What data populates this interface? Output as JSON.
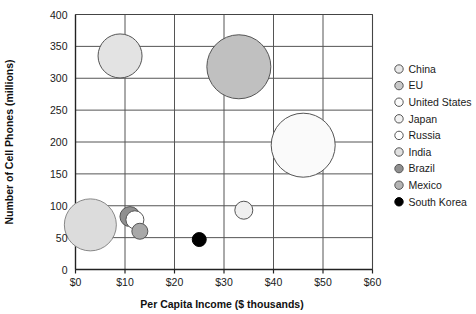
{
  "chart_data": {
    "type": "scatter",
    "variant": "bubble",
    "title": "",
    "xlabel": "Per Capita Income ($ thousands)",
    "ylabel": "Number of Cell Phones (millions)",
    "xlim": [
      0,
      60
    ],
    "ylim": [
      0,
      400
    ],
    "xticks": [
      0,
      10,
      20,
      30,
      40,
      50,
      60
    ],
    "xtick_labels": [
      "$0",
      "$10",
      "$20",
      "$30",
      "$40",
      "$50",
      "$60"
    ],
    "yticks": [
      0,
      50,
      100,
      150,
      200,
      250,
      300,
      350,
      400
    ],
    "ytick_labels": [
      "0",
      "50",
      "100",
      "150",
      "200",
      "250",
      "300",
      "350",
      "400"
    ],
    "grid": true,
    "grid_color": "#555555",
    "legend_position": "right",
    "points": [
      {
        "name": "China",
        "x": 9,
        "y": 335,
        "r_px": 22,
        "fill": "#e3e3e3",
        "stroke": "#555555"
      },
      {
        "name": "EU",
        "x": 33,
        "y": 318,
        "r_px": 32,
        "fill": "#c0c0c0",
        "stroke": "#555555"
      },
      {
        "name": "United States",
        "x": 46,
        "y": 195,
        "r_px": 32,
        "fill": "#fafafa",
        "stroke": "#555555"
      },
      {
        "name": "Japan",
        "x": 34,
        "y": 93,
        "r_px": 9,
        "fill": "#f0f0f0",
        "stroke": "#555555"
      },
      {
        "name": "Russia",
        "x": 12,
        "y": 78,
        "r_px": 9,
        "fill": "#ffffff",
        "stroke": "#555555"
      },
      {
        "name": "India",
        "x": 3,
        "y": 70,
        "r_px": 26,
        "fill": "#dcdcdc",
        "stroke": "#888888"
      },
      {
        "name": "Brazil",
        "x": 11,
        "y": 83,
        "r_px": 10,
        "fill": "#8f8f8f",
        "stroke": "#555555"
      },
      {
        "name": "Mexico",
        "x": 13,
        "y": 60,
        "r_px": 8,
        "fill": "#a8a8a8",
        "stroke": "#555555"
      },
      {
        "name": "South Korea",
        "x": 25,
        "y": 47,
        "r_px": 7,
        "fill": "#000000",
        "stroke": "#000000"
      }
    ]
  },
  "legend": {
    "items": [
      {
        "label": "China",
        "fill": "#e8e8e8",
        "stroke": "#555555"
      },
      {
        "label": "EU",
        "fill": "#c8c8c8",
        "stroke": "#555555"
      },
      {
        "label": "United States",
        "fill": "#fbfbfb",
        "stroke": "#555555"
      },
      {
        "label": "Japan",
        "fill": "#f2f2f2",
        "stroke": "#555555"
      },
      {
        "label": "Russia",
        "fill": "#ffffff",
        "stroke": "#555555"
      },
      {
        "label": "India",
        "fill": "#e0e0e0",
        "stroke": "#555555"
      },
      {
        "label": "Brazil",
        "fill": "#8f8f8f",
        "stroke": "#555555"
      },
      {
        "label": "Mexico",
        "fill": "#b4b4b4",
        "stroke": "#555555"
      },
      {
        "label": "South Korea",
        "fill": "#000000",
        "stroke": "#000000"
      }
    ]
  }
}
